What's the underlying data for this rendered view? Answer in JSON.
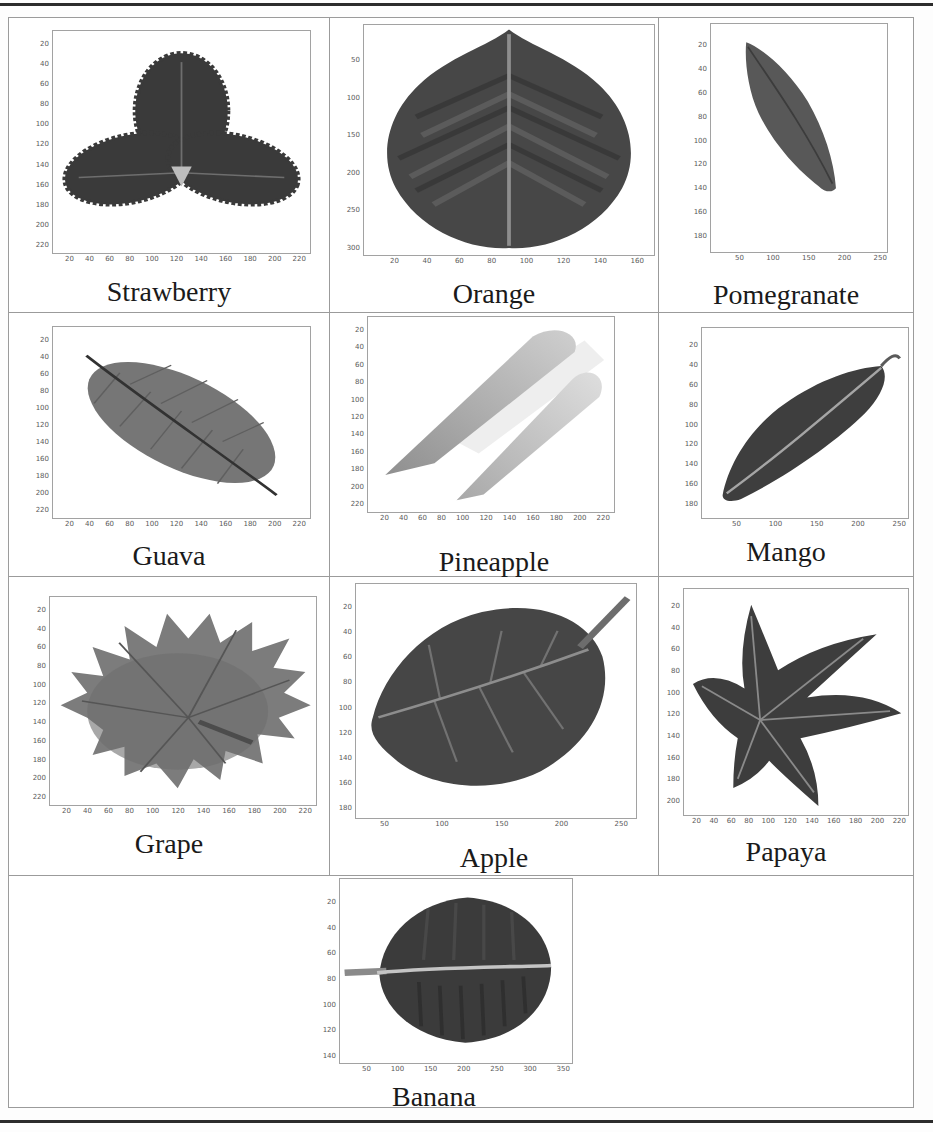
{
  "cells": [
    {
      "label": "Strawberry",
      "y_ticks": [
        "20",
        "40",
        "60",
        "80",
        "100",
        "120",
        "140",
        "160",
        "180",
        "200",
        "220"
      ],
      "x_ticks": [
        "20",
        "40",
        "60",
        "80",
        "100",
        "120",
        "140",
        "160",
        "180",
        "200",
        "220"
      ]
    },
    {
      "label": "Orange",
      "y_ticks": [
        "50",
        "100",
        "150",
        "200",
        "250",
        "300"
      ],
      "x_ticks": [
        "20",
        "40",
        "60",
        "80",
        "100",
        "120",
        "140",
        "160"
      ]
    },
    {
      "label": "Pomegranate",
      "y_ticks": [
        "20",
        "40",
        "60",
        "80",
        "100",
        "120",
        "140",
        "160",
        "180"
      ],
      "x_ticks": [
        "50",
        "100",
        "150",
        "200",
        "250"
      ]
    },
    {
      "label": "Guava",
      "y_ticks": [
        "20",
        "40",
        "60",
        "80",
        "100",
        "120",
        "140",
        "160",
        "180",
        "200",
        "220"
      ],
      "x_ticks": [
        "20",
        "40",
        "60",
        "80",
        "100",
        "120",
        "140",
        "160",
        "180",
        "200",
        "220"
      ]
    },
    {
      "label": "Pineapple",
      "y_ticks": [
        "20",
        "40",
        "60",
        "80",
        "100",
        "120",
        "140",
        "160",
        "180",
        "200",
        "220"
      ],
      "x_ticks": [
        "20",
        "40",
        "60",
        "80",
        "100",
        "120",
        "140",
        "160",
        "180",
        "200",
        "220"
      ]
    },
    {
      "label": "Mango",
      "y_ticks": [
        "20",
        "40",
        "60",
        "80",
        "100",
        "120",
        "140",
        "160",
        "180"
      ],
      "x_ticks": [
        "50",
        "100",
        "150",
        "200",
        "250"
      ]
    },
    {
      "label": "Grape",
      "y_ticks": [
        "20",
        "40",
        "60",
        "80",
        "100",
        "120",
        "140",
        "160",
        "180",
        "200",
        "220"
      ],
      "x_ticks": [
        "20",
        "40",
        "60",
        "80",
        "100",
        "120",
        "140",
        "160",
        "180",
        "200",
        "220"
      ]
    },
    {
      "label": "Apple",
      "y_ticks": [
        "20",
        "40",
        "60",
        "80",
        "100",
        "120",
        "140",
        "160",
        "180"
      ],
      "x_ticks": [
        "50",
        "100",
        "150",
        "200",
        "250"
      ]
    },
    {
      "label": "Papaya",
      "y_ticks": [
        "20",
        "40",
        "60",
        "80",
        "100",
        "120",
        "140",
        "160",
        "180",
        "200"
      ],
      "x_ticks": [
        "20",
        "40",
        "60",
        "80",
        "100",
        "120",
        "140",
        "160",
        "180",
        "200",
        "220"
      ]
    },
    {
      "label": "Banana",
      "y_ticks": [
        "20",
        "40",
        "60",
        "80",
        "100",
        "120",
        "140"
      ],
      "x_ticks": [
        "50",
        "100",
        "150",
        "200",
        "250",
        "300",
        "350"
      ]
    }
  ]
}
